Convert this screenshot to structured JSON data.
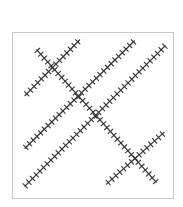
{
  "diagram": {
    "stroke_color": "#333333",
    "frame_color": "#c8c8c8",
    "background": "#ffffff",
    "units": "percent of frame (0-100, origin top-left)",
    "lines": [
      {
        "id": "line-a",
        "direction": "rising",
        "from": [
          8.0,
          38.1
        ],
        "to": [
          41.7,
          4.8
        ]
      },
      {
        "id": "line-b",
        "direction": "rising",
        "from": [
          8.0,
          69.6
        ],
        "to": [
          75.5,
          5.4
        ]
      },
      {
        "id": "line-c",
        "direction": "rising",
        "from": [
          8.0,
          92.3
        ],
        "to": [
          94.5,
          8.3
        ]
      },
      {
        "id": "line-d",
        "direction": "rising",
        "from": [
          58.3,
          91.1
        ],
        "to": [
          93.9,
          60.1
        ]
      },
      {
        "id": "line-e",
        "direction": "falling",
        "from": [
          15.3,
          10.7
        ],
        "to": [
          89.0,
          89.9
        ]
      }
    ]
  }
}
